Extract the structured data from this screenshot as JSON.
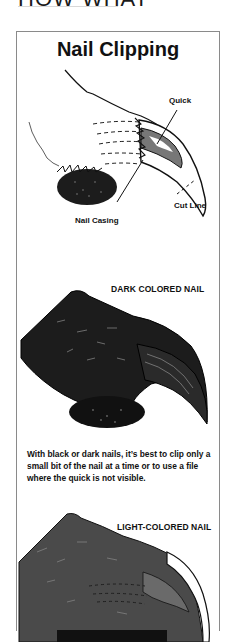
{
  "page": {
    "cut_heading": "HOW WHAT"
  },
  "figure": {
    "title": "Nail Clipping",
    "diagram1": {
      "labels": {
        "quick": "Quick",
        "cut_line": "Cut Line",
        "nail_casing": "Nail Casing"
      }
    },
    "diagram2": {
      "label": "DARK COLORED NAIL",
      "caption": "With black or dark nails, it’s best to clip only a small bit of the nail at a time or to use a file where the quick is not visible."
    },
    "diagram3": {
      "label": "LIGHT-COLORED NAIL"
    },
    "colors": {
      "frame_border": "#8a8a8a",
      "ink": "#111111",
      "dark_fur": "#1c1c1c",
      "grey_fur": "#4a4a4a"
    }
  }
}
